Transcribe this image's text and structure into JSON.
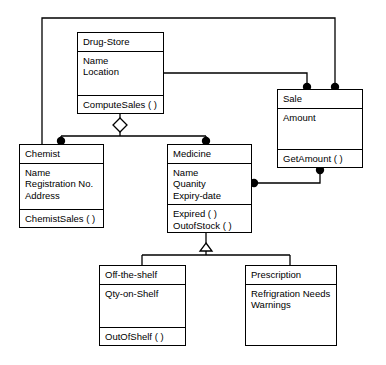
{
  "diagram": {
    "type": "uml-class-diagram",
    "background_color": "#ffffff",
    "line_color": "#000000",
    "text_color": "#000000",
    "classes": [
      {
        "id": "drug-store",
        "name": "Drug-Store",
        "attributes": [
          "Name",
          "Location"
        ],
        "operations": [
          "ComputeSales ( )"
        ],
        "x": 77,
        "y": 32,
        "width": 87,
        "height": 82
      },
      {
        "id": "sale",
        "name": "Sale",
        "attributes": [
          "Amount"
        ],
        "operations": [
          "GetAmount ( )"
        ],
        "x": 277,
        "y": 89,
        "width": 86,
        "height": 79
      },
      {
        "id": "chemist",
        "name": "Chemist",
        "attributes": [
          "Name",
          "Registration No.",
          "Address"
        ],
        "operations": [
          "ChemistSales ( )"
        ],
        "x": 19,
        "y": 144,
        "width": 85,
        "height": 84
      },
      {
        "id": "medicine",
        "name": "Medicine",
        "attributes": [
          "Name",
          "Quanity",
          "Expiry-date"
        ],
        "operations": [
          "Expired ( )",
          "OutofStock ( )"
        ],
        "x": 167,
        "y": 144,
        "width": 85,
        "height": 89
      },
      {
        "id": "off-the-shelf",
        "name": "Off-the-shelf",
        "attributes": [
          "Qty-on-Shelf"
        ],
        "operations": [
          "OutOfShelf ( )"
        ],
        "x": 99,
        "y": 265,
        "width": 87,
        "height": 81
      },
      {
        "id": "prescription",
        "name": "Prescription",
        "attributes": [
          "Refrigration Needs",
          "Warnings"
        ],
        "operations": [],
        "x": 245,
        "y": 265,
        "width": 92,
        "height": 81
      }
    ],
    "relationships": [
      {
        "id": "drugstore-sale-top",
        "type": "association",
        "from": "chemist",
        "to": "sale",
        "from_end": "filled-circle",
        "to_end": "plain"
      },
      {
        "id": "drugstore-sale-right",
        "type": "association",
        "from": "drug-store",
        "to": "sale",
        "from_end": "plain",
        "to_end": "filled-circle"
      },
      {
        "id": "sale-medicine",
        "type": "association",
        "from": "sale",
        "to": "medicine",
        "from_end": "filled-circle",
        "to_end": "filled-circle"
      },
      {
        "id": "drugstore-aggregation",
        "type": "aggregation",
        "from": "drug-store",
        "to": [
          "chemist",
          "medicine"
        ],
        "from_end": "hollow-diamond",
        "to_end": "filled-circle"
      },
      {
        "id": "medicine-generalization",
        "type": "generalization",
        "from": [
          "off-the-shelf",
          "prescription"
        ],
        "to": "medicine",
        "to_end": "hollow-triangle"
      }
    ]
  }
}
